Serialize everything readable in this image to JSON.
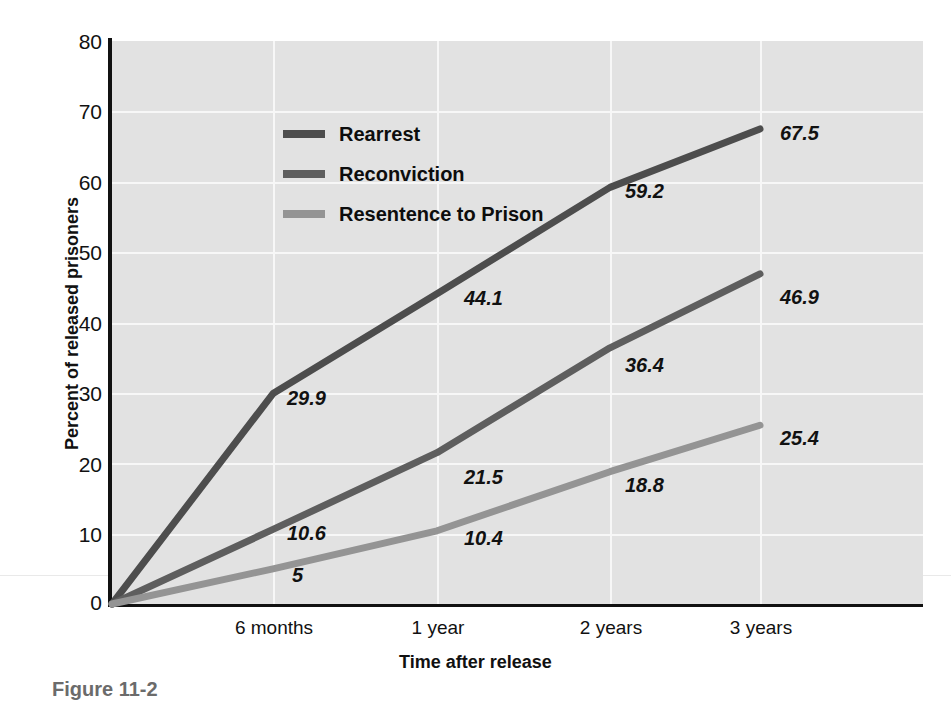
{
  "caption": "Figure 11-2",
  "chart_data": {
    "type": "line",
    "title": "",
    "xlabel": "Time after release",
    "ylabel": "Percent of released prisoners",
    "categories": [
      "Release",
      "6 months",
      "1 year",
      "2 years",
      "3 years"
    ],
    "xtick_labels": [
      "6 months",
      "1 year",
      "2 years",
      "3 years"
    ],
    "ylim": [
      0,
      80
    ],
    "yticks": [
      0,
      10,
      20,
      30,
      40,
      50,
      60,
      70,
      80
    ],
    "grid": true,
    "legend_position": "top-left",
    "series": [
      {
        "name": "Rearrest",
        "color": "#4d4d4d",
        "values": [
          0,
          29.9,
          44.1,
          59.2,
          67.5
        ],
        "point_labels": [
          "",
          "29.9",
          "44.1",
          "59.2",
          "67.5"
        ]
      },
      {
        "name": "Reconviction",
        "color": "#5e5e5e",
        "values": [
          0,
          10.6,
          21.5,
          36.4,
          46.9
        ],
        "point_labels": [
          "",
          "10.6",
          "21.5",
          "36.4",
          "46.9"
        ]
      },
      {
        "name": "Resentence to Prison",
        "color": "#949494",
        "values": [
          0,
          5,
          10.4,
          18.8,
          25.4
        ],
        "point_labels": [
          "",
          "5",
          "10.4",
          "18.8",
          "25.4"
        ]
      }
    ]
  },
  "yticks": {
    "t0": "0",
    "t10": "10",
    "t20": "20",
    "t30": "30",
    "t40": "40",
    "t50": "50",
    "t60": "60",
    "t70": "70",
    "t80": "80"
  },
  "xticks": {
    "x1": "6 months",
    "x2": "1 year",
    "x3": "2 years",
    "x4": "3 years"
  },
  "axis_titles": {
    "x": "Time after release",
    "y": "Percent of released prisoners"
  },
  "legend": {
    "item1": "Rearrest",
    "item2": "Reconviction",
    "item3": "Resentence to Prison"
  },
  "labels": {
    "rearrest_6mo": "29.9",
    "rearrest_1yr": "44.1",
    "rearrest_2yr": "59.2",
    "rearrest_3yr": "67.5",
    "reconv_6mo": "10.6",
    "reconv_1yr": "21.5",
    "reconv_2yr": "36.4",
    "reconv_3yr": "46.9",
    "resent_6mo": "5",
    "resent_1yr": "10.4",
    "resent_2yr": "18.8",
    "resent_3yr": "25.4"
  },
  "colors": {
    "rearrest": "#4d4d4d",
    "reconviction": "#5e5e5e",
    "resentence": "#949494",
    "plot_background": "#e2e2e2",
    "gridline": "#f7f7f7",
    "axis": "#111111"
  }
}
